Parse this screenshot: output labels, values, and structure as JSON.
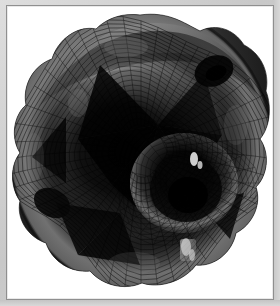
{
  "window": {
    "title": "Surface Plot",
    "background_color": "#cdcdcd",
    "frame_border_color": "#8f8f8f",
    "canvas_color": "#ffffff"
  },
  "figure": {
    "kind": "3d-surface-mesh",
    "caption": "",
    "mesh_line_color": "#050505",
    "surface_light_color": "#a6a6a6",
    "surface_mid_color": "#4a4a4a",
    "surface_dark_color": "#0a0a0a",
    "specular_color": "#e8e8e8",
    "center": {
      "x": 139,
      "y": 150
    },
    "radius": 128,
    "mesh_u_divisions": 48,
    "mesh_v_divisions": 26,
    "symmetry_order": 4,
    "spike_count": 4,
    "hole_count": 1,
    "labels": {
      "title": "",
      "xlabel": "",
      "ylabel": "",
      "zlabel": ""
    },
    "axes_visible": false,
    "legend_visible": false,
    "ticks_visible": false
  }
}
